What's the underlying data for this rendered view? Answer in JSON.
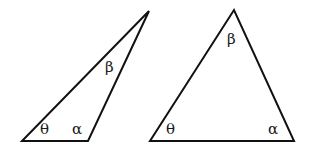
{
  "diagram": {
    "stroke_color": "#111111",
    "background": "#ffffff",
    "triangles": [
      {
        "name": "obtuse-triangle",
        "vertices": [
          [
            22,
            141
          ],
          [
            88,
            141
          ],
          [
            149,
            11
          ]
        ],
        "angles": {
          "theta": {
            "symbol": "θ",
            "x": 40,
            "y": 134
          },
          "alpha": {
            "symbol": "α",
            "x": 72,
            "y": 134
          },
          "beta": {
            "symbol": "β",
            "x": 105,
            "y": 72
          }
        }
      },
      {
        "name": "acute-triangle",
        "vertices": [
          [
            150,
            141
          ],
          [
            294,
            141
          ],
          [
            234,
            10
          ]
        ],
        "angles": {
          "theta": {
            "symbol": "θ",
            "x": 166,
            "y": 134
          },
          "alpha": {
            "symbol": "α",
            "x": 268,
            "y": 134
          },
          "beta": {
            "symbol": "β",
            "x": 227,
            "y": 44
          }
        }
      }
    ]
  }
}
